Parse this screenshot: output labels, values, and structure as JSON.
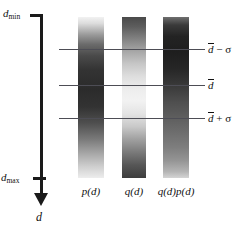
{
  "figure": {
    "background_color": "#ffffff",
    "ink_color": "#1a1a1a",
    "line_color": "#4d4d55"
  },
  "axis": {
    "orientation": "vertical-downward",
    "variable_label": "d",
    "top_label_main": "d",
    "top_label_sub": "min",
    "bottom_label_main": "d",
    "bottom_label_sub": "max",
    "tick_top_value": "d_min",
    "tick_bottom_value": "d_max",
    "arrow_direction": "down"
  },
  "stat_lines": [
    {
      "id": "minus-sigma",
      "label_mean": "d",
      "label_op": " − ",
      "label_sigma": "σ",
      "y_px": 49
    },
    {
      "id": "mean",
      "label_mean": "d",
      "label_op": "",
      "label_sigma": "",
      "y_px": 85
    },
    {
      "id": "plus-sigma",
      "label_mean": "d",
      "label_op": " + ",
      "label_sigma": "σ",
      "y_px": 118
    }
  ],
  "bars": [
    {
      "id": "p",
      "caption": "p(d)",
      "description": "light at top, dark through middle, fading light toward bottom",
      "gradient": "linear-gradient(to bottom, #f2f2f2 0%, #dcdcdc 4%, #9a9a9a 11%, #6b6b6b 17%, #4a4a4a 24%, #333333 33%, #2b2b2b 45%, #333333 56%, #4f4f4f 66%, #7a7a7a 76%, #a8a8a8 85%, #cfcfcf 93%, #ededed 100%)"
    },
    {
      "id": "q",
      "caption": "q(d)",
      "description": "dark at top, lightest in middle, dark again at bottom",
      "gradient": "linear-gradient(to bottom, #4a4a4a 0%, #5d5d5d 6%, #7f7f7f 13%, #a5a5a5 21%, #c6c6c6 29%, #dedede 37%, #ededed 45%, #f2f2f2 52%, #e4e4e4 60%, #c9c9c9 68%, #a0a0a0 76%, #7a7a7a 84%, #565656 92%, #3d3d3d 100%)"
    },
    {
      "id": "qp",
      "caption": "q(d)p(d)",
      "description": "darkest at top, progressively lighter toward bottom",
      "gradient": "linear-gradient(to bottom, #6f6f6f 0%, #3a3a3a 5%, #232323 12%, #1e1e1e 22%, #262626 32%, #3a3a3a 43%, #4f4f4f 53%, #5f5f5f 63%, #6e6e6e 72%, #7e7e7e 81%, #949494 89%, #b4b4b4 96%, #d4d4d4 100%)"
    }
  ]
}
